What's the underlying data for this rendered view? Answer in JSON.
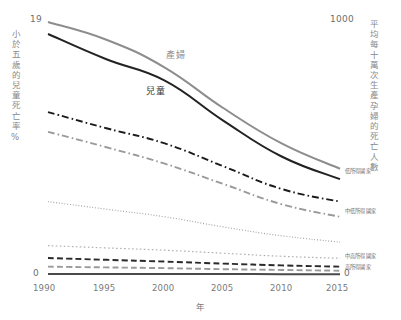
{
  "chart_data": {
    "type": "line",
    "title": "",
    "x": [
      1990,
      1995,
      2000,
      2005,
      2010,
      2015
    ],
    "xlabel": "年",
    "xticks": [
      "1990",
      "1995",
      "2000",
      "2005",
      "2010",
      "2015"
    ],
    "xlim": [
      1990,
      2015
    ],
    "grid": false,
    "legend_position": "inline-right",
    "left_axis": {
      "label": "小於五歲的兒童死亡率%",
      "max_tick": "19",
      "min_tick": "0",
      "ylim": [
        0,
        19
      ]
    },
    "right_axis": {
      "label": "平均每十萬次生產孕婦的死亡人數",
      "max_tick": "1000",
      "min_tick": "0",
      "ylim": [
        0,
        1000
      ]
    },
    "inline_labels": [
      {
        "text": "產婦",
        "color": "#8d8d8d"
      },
      {
        "text": "兒童",
        "color": "#3a3a3a"
      }
    ],
    "series": [
      {
        "name": "產婦",
        "axis": "right",
        "style": "solid",
        "color": "#8d8d8d",
        "values": [
          1000,
          930,
          820,
          660,
          520,
          420
        ]
      },
      {
        "name": "兒童",
        "axis": "left",
        "style": "solid",
        "color": "#222222",
        "values": [
          18.1,
          16.2,
          14.6,
          11.6,
          8.9,
          7.2
        ]
      },
      {
        "name": "低所得國家",
        "axis": "right",
        "style": "dash-dot",
        "color": "#1a1a1a",
        "values": [
          644,
          580,
          520,
          430,
          340,
          290
        ]
      },
      {
        "name": "中低所得國家",
        "axis": "right",
        "style": "dash-dot",
        "color": "#9a9a9a",
        "values": [
          566,
          505,
          440,
          360,
          280,
          230
        ]
      },
      {
        "name": "中高所得國家",
        "axis": "right",
        "style": "fine-dot",
        "color": "#a8a8a8",
        "values": [
          290,
          260,
          230,
          190,
          155,
          130
        ]
      },
      {
        "name": "高所得國家",
        "axis": "right",
        "style": "dot",
        "color": "#b0b0b0",
        "values": [
          116,
          107,
          98,
          86,
          74,
          66
        ]
      },
      {
        "name": "dashed-dark-low",
        "axis": "right",
        "style": "dash",
        "color": "#2a2a2a",
        "values": [
          67,
          60,
          53,
          45,
          38,
          33
        ]
      },
      {
        "name": "dashed-gray-low",
        "axis": "right",
        "style": "dash",
        "color": "#9a9a9a",
        "values": [
          33,
          30,
          27,
          23,
          20,
          17
        ]
      },
      {
        "name": "baseline",
        "axis": "right",
        "style": "solid",
        "color": "#4a4a4a",
        "values": [
          4,
          4,
          4,
          4,
          3,
          3
        ]
      }
    ],
    "right_series_labels": [
      {
        "text": "低所得國家"
      },
      {
        "text": "中低所得國家"
      },
      {
        "text": "中高所得國家"
      },
      {
        "text": "高所得國家"
      },
      {
        "text": "0"
      }
    ]
  }
}
